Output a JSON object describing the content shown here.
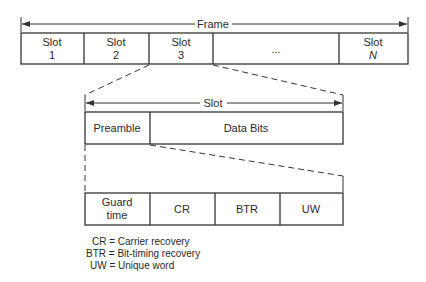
{
  "frame": {
    "label": "Frame",
    "slots": [
      {
        "line1": "Slot",
        "line2": "1"
      },
      {
        "line1": "Slot",
        "line2": "2"
      },
      {
        "line1": "Slot",
        "line2": "3"
      },
      {
        "line1": "...",
        "line2": ""
      },
      {
        "line1": "Slot",
        "line2": "N"
      }
    ]
  },
  "slot": {
    "label": "Slot",
    "fields": [
      "Preamble",
      "Data Bits"
    ]
  },
  "preamble": {
    "fields": [
      {
        "line1": "Guard",
        "line2": "time"
      },
      {
        "line1": "CR",
        "line2": ""
      },
      {
        "line1": "BTR",
        "line2": ""
      },
      {
        "line1": "UW",
        "line2": ""
      }
    ]
  },
  "legend": [
    "CR = Carrier recovery",
    "BTR = Bit-timing recovery",
    "UW = Unique word"
  ]
}
